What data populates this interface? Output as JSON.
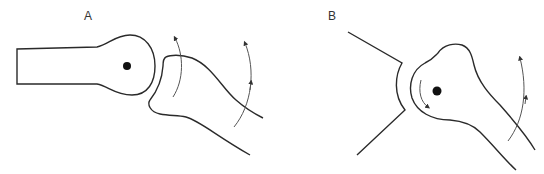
{
  "figure": {
    "panels": [
      {
        "id": "A",
        "label": "A",
        "description": "Ball-shaped bone end articulating with concave surface of adjacent bone; curved arrows indicate rotation of the distal bone"
      },
      {
        "id": "B",
        "label": "B",
        "description": "Rounded bone head in concave socket with axis dot; small curved arrow shows spin of head, large curved arrow shows swing of shaft"
      }
    ]
  },
  "colors": {
    "stroke": "#2a2a2a",
    "arrow": "#555555",
    "background": "#ffffff"
  }
}
